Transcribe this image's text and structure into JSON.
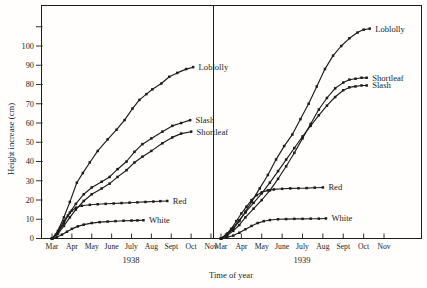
{
  "figure": {
    "ink_color": "#1c1c1c",
    "background_color": "#fffefd"
  },
  "chart_data": {
    "type": "line",
    "title": "",
    "xlabel": "Time of year",
    "ylabel": "Height increase (cm)",
    "ylim": [
      0,
      121
    ],
    "grid": false,
    "legend_position": "inline-right-of-curve-end",
    "y_unit": "cm",
    "x_unit": "months (0 = Mar ... 8 = Nov)",
    "yticks_labeled": [
      0,
      10,
      20,
      30,
      40,
      50,
      60,
      70,
      80,
      90,
      100
    ],
    "yticks_unlabeled": [
      110
    ],
    "panels": [
      {
        "year": "1938",
        "months": [
          "Mar",
          "Apr",
          "May",
          "June",
          "July",
          "Aug",
          "Sept",
          "Oct",
          "Nov"
        ],
        "series": [
          {
            "name": "Loblolly",
            "points": [
              [
                0,
                0
              ],
              [
                0.3,
                4
              ],
              [
                0.6,
                11
              ],
              [
                0.9,
                19
              ],
              [
                1.25,
                29
              ],
              [
                1.55,
                34
              ],
              [
                1.9,
                39.5
              ],
              [
                2.3,
                45.5
              ],
              [
                2.8,
                51.5
              ],
              [
                3.25,
                56.5
              ],
              [
                3.65,
                61.5
              ],
              [
                4.05,
                67.5
              ],
              [
                4.4,
                72
              ],
              [
                4.75,
                75
              ],
              [
                5.05,
                77.5
              ],
              [
                5.5,
                80.5
              ],
              [
                5.9,
                84
              ],
              [
                6.3,
                86
              ],
              [
                6.75,
                88
              ],
              [
                7.1,
                89
              ]
            ]
          },
          {
            "name": "Slash",
            "points": [
              [
                0,
                0
              ],
              [
                0.3,
                3
              ],
              [
                0.6,
                8
              ],
              [
                0.9,
                13.5
              ],
              [
                1.2,
                18
              ],
              [
                1.6,
                23
              ],
              [
                2.0,
                26.5
              ],
              [
                2.5,
                29.5
              ],
              [
                2.9,
                32
              ],
              [
                3.3,
                36
              ],
              [
                3.75,
                40
              ],
              [
                4.15,
                45
              ],
              [
                4.55,
                49
              ],
              [
                5.0,
                52
              ],
              [
                5.55,
                55.5
              ],
              [
                6.05,
                58.5
              ],
              [
                6.5,
                60
              ],
              [
                6.95,
                61.5
              ]
            ]
          },
          {
            "name": "Shortleaf",
            "points": [
              [
                0,
                0
              ],
              [
                0.3,
                2.5
              ],
              [
                0.6,
                6.5
              ],
              [
                0.9,
                11
              ],
              [
                1.2,
                15
              ],
              [
                1.6,
                19.5
              ],
              [
                2.0,
                23
              ],
              [
                2.5,
                26
              ],
              [
                2.9,
                28.5
              ],
              [
                3.3,
                32
              ],
              [
                3.75,
                35.5
              ],
              [
                4.15,
                39.5
              ],
              [
                4.55,
                42.5
              ],
              [
                5.0,
                45.5
              ],
              [
                5.55,
                49.5
              ],
              [
                6.05,
                52.5
              ],
              [
                6.5,
                54.5
              ],
              [
                7.0,
                55.5
              ]
            ]
          },
          {
            "name": "Red",
            "points": [
              [
                0,
                0
              ],
              [
                0.2,
                2
              ],
              [
                0.4,
                5.5
              ],
              [
                0.6,
                9
              ],
              [
                0.8,
                12
              ],
              [
                1.0,
                14.5
              ],
              [
                1.2,
                16
              ],
              [
                1.5,
                17
              ],
              [
                1.9,
                17.5
              ],
              [
                2.3,
                17.8
              ],
              [
                2.7,
                18
              ],
              [
                3.1,
                18.2
              ],
              [
                3.5,
                18.4
              ],
              [
                3.9,
                18.6
              ],
              [
                4.3,
                18.8
              ],
              [
                4.7,
                19
              ],
              [
                5.1,
                19.2
              ],
              [
                5.45,
                19.4
              ],
              [
                5.8,
                19.5
              ]
            ]
          },
          {
            "name": "White",
            "points": [
              [
                0,
                0
              ],
              [
                0.25,
                0.8
              ],
              [
                0.5,
                2
              ],
              [
                0.75,
                3.5
              ],
              [
                1.0,
                5
              ],
              [
                1.3,
                6.3
              ],
              [
                1.6,
                7.2
              ],
              [
                2.0,
                8
              ],
              [
                2.4,
                8.5
              ],
              [
                2.8,
                8.8
              ],
              [
                3.2,
                9
              ],
              [
                3.6,
                9.2
              ],
              [
                4.0,
                9.3
              ],
              [
                4.3,
                9.4
              ],
              [
                4.6,
                9.5
              ]
            ]
          }
        ]
      },
      {
        "year": "1939",
        "months": [
          "Mar",
          "Apr",
          "May",
          "June",
          "July",
          "Aug",
          "Sept",
          "Oct",
          "Nov"
        ],
        "series": [
          {
            "name": "Loblolly",
            "points": [
              [
                0,
                0
              ],
              [
                0.3,
                2
              ],
              [
                0.6,
                5
              ],
              [
                0.9,
                9
              ],
              [
                1.2,
                14
              ],
              [
                1.5,
                19
              ],
              [
                1.9,
                26
              ],
              [
                2.3,
                33
              ],
              [
                2.7,
                41
              ],
              [
                3.1,
                48
              ],
              [
                3.5,
                54
              ],
              [
                3.9,
                62
              ],
              [
                4.3,
                70
              ],
              [
                4.7,
                79
              ],
              [
                5.1,
                88
              ],
              [
                5.5,
                95
              ],
              [
                5.9,
                100
              ],
              [
                6.3,
                104
              ],
              [
                6.7,
                107
              ],
              [
                7.0,
                108.5
              ],
              [
                7.3,
                109
              ]
            ]
          },
          {
            "name": "Shortleaf",
            "points": [
              [
                0,
                0
              ],
              [
                0.3,
                1.5
              ],
              [
                0.6,
                4
              ],
              [
                0.9,
                7
              ],
              [
                1.2,
                11
              ],
              [
                1.6,
                15.5
              ],
              [
                2.0,
                20
              ],
              [
                2.4,
                25
              ],
              [
                2.8,
                31
              ],
              [
                3.2,
                37.5
              ],
              [
                3.6,
                44.5
              ],
              [
                4.0,
                52
              ],
              [
                4.4,
                59.5
              ],
              [
                4.8,
                67
              ],
              [
                5.2,
                73
              ],
              [
                5.6,
                78
              ],
              [
                6.0,
                81
              ],
              [
                6.3,
                82.5
              ],
              [
                6.6,
                83
              ],
              [
                6.9,
                83.5
              ],
              [
                7.15,
                83.5
              ]
            ]
          },
          {
            "name": "Slash",
            "points": [
              [
                0,
                0
              ],
              [
                0.3,
                2.5
              ],
              [
                0.6,
                5.5
              ],
              [
                0.9,
                9.5
              ],
              [
                1.2,
                13.5
              ],
              [
                1.6,
                18.5
              ],
              [
                2.0,
                23.5
              ],
              [
                2.4,
                29
              ],
              [
                2.8,
                35
              ],
              [
                3.2,
                41
              ],
              [
                3.6,
                47
              ],
              [
                4.0,
                53
              ],
              [
                4.4,
                58.5
              ],
              [
                4.8,
                64
              ],
              [
                5.2,
                69
              ],
              [
                5.6,
                73.5
              ],
              [
                6.0,
                77
              ],
              [
                6.3,
                78.5
              ],
              [
                6.6,
                79
              ],
              [
                6.9,
                79.5
              ],
              [
                7.15,
                79.5
              ]
            ]
          },
          {
            "name": "Red",
            "points": [
              [
                0,
                0
              ],
              [
                0.25,
                2
              ],
              [
                0.5,
                5
              ],
              [
                0.75,
                9
              ],
              [
                1.0,
                13
              ],
              [
                1.25,
                16.5
              ],
              [
                1.5,
                20
              ],
              [
                1.75,
                22.5
              ],
              [
                2.0,
                24
              ],
              [
                2.3,
                25
              ],
              [
                2.6,
                25.5
              ],
              [
                3.0,
                25.8
              ],
              [
                3.4,
                26
              ],
              [
                3.8,
                26.1
              ],
              [
                4.2,
                26.2
              ],
              [
                4.6,
                26.4
              ],
              [
                5.0,
                26.5
              ]
            ]
          },
          {
            "name": "White",
            "points": [
              [
                0,
                0
              ],
              [
                0.3,
                0.6
              ],
              [
                0.6,
                1.5
              ],
              [
                0.9,
                3
              ],
              [
                1.2,
                4.8
              ],
              [
                1.5,
                6.5
              ],
              [
                1.8,
                8
              ],
              [
                2.1,
                9
              ],
              [
                2.4,
                9.6
              ],
              [
                2.8,
                10
              ],
              [
                3.2,
                10.1
              ],
              [
                3.6,
                10.2
              ],
              [
                4.0,
                10.2
              ],
              [
                4.4,
                10.3
              ],
              [
                4.8,
                10.3
              ],
              [
                5.15,
                10.4
              ]
            ]
          }
        ]
      }
    ]
  }
}
